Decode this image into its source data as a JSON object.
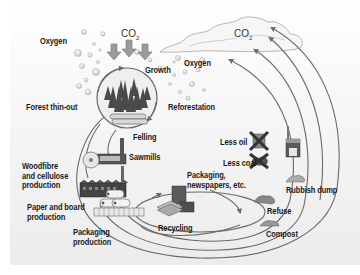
{
  "diagram": {
    "colors": {
      "background": "#f0f0f0",
      "arrow": "#6a6a6a",
      "text": "#1a1a1a",
      "tree": "#4a4a4a"
    },
    "labels": {
      "oxygen_left": "Oxygen",
      "co2_top": "CO",
      "co2_top_sub": "2",
      "co2_cloud": "CO",
      "co2_cloud_sub": "2",
      "growth": "Growth",
      "oxygen_right": "Oxygen",
      "forest_thin_out": "Forest thin-out",
      "reforestation": "Reforestation",
      "felling": "Felling",
      "sawmills": "Sawmills",
      "woodfibre_1": "Woodfibre",
      "woodfibre_2": "and cellulose",
      "woodfibre_3": "production",
      "paper_board_1": "Paper and board",
      "paper_board_2": "production",
      "packaging_prod_1": "Packaging",
      "packaging_prod_2": "production",
      "recycling": "Recycling",
      "packaging_news_1": "Packaging,",
      "packaging_news_2": "newspapers, etc.",
      "less_oil": "Less oil",
      "less_coal": "Less coal",
      "rubbish_dump": "Rubbish dump",
      "refuse": "Refuse",
      "compost": "Compost"
    },
    "icons": [
      "oxygen-bubbles-icon",
      "co2-down-arrows-icon",
      "co2-cloud-icon",
      "forest-circle-icon",
      "logs-icon",
      "sawmill-icon",
      "saw-blade-icon",
      "pulp-factory-icon",
      "paper-rolls-icon",
      "packaging-pallet-icon",
      "recycling-boxes-icon",
      "oil-barrel-crossed-icon",
      "coal-crossed-icon",
      "incinerator-icon",
      "rubbish-pile-icon",
      "refuse-pile-icon",
      "compost-pile-icon"
    ]
  }
}
